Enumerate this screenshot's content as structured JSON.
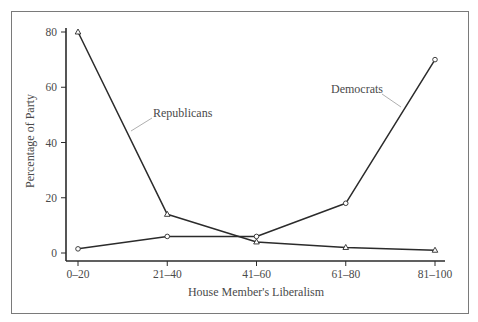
{
  "chart_data": {
    "type": "line",
    "title": "",
    "xlabel": "House Member's Liberalism",
    "ylabel": "Percentage of Party",
    "categories": [
      "0–20",
      "21–40",
      "41–60",
      "61–80",
      "81–100"
    ],
    "yticks": [
      0,
      20,
      40,
      60,
      80
    ],
    "ylim": [
      0,
      80
    ],
    "grid": false,
    "legend": "inline labels with leader lines",
    "series": [
      {
        "name": "Republicans",
        "marker": "triangle",
        "values": [
          80,
          14,
          4,
          2,
          1
        ]
      },
      {
        "name": "Democrats",
        "marker": "circle",
        "values": [
          1.5,
          6,
          6,
          18,
          70
        ]
      }
    ]
  },
  "colors": {
    "line": "#2b2b2b",
    "axis": "#2b2b2b",
    "frame": "#7a7a7a",
    "label_text": "#4a4a4a",
    "leader": "#9a9a9a"
  },
  "labels": {
    "republicans": "Republicans",
    "democrats": "Democrats"
  }
}
